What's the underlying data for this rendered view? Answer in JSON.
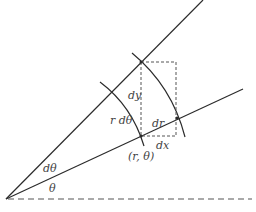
{
  "diagram": {
    "labels": {
      "dy": "dy",
      "r_dtheta": "r dθ",
      "dr": "dr",
      "dx": "dx",
      "point": "(r, θ)",
      "dtheta": "dθ",
      "theta": "θ"
    },
    "colors": {
      "line": "#2b2b2b",
      "dashed": "#555555",
      "text": "#444444",
      "background": "#ffffff"
    }
  }
}
